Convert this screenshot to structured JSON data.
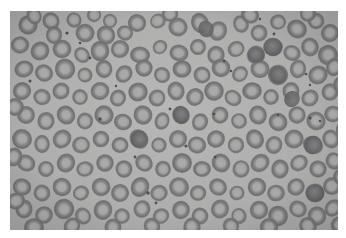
{
  "figure": {
    "kind": "photomicrograph",
    "modality": "light-microscopy",
    "stain": "unstained-grayscale",
    "specimen": "peripheral-blood-smear",
    "title": "Peripheral blood smear photomicrograph",
    "frame": {
      "canvas_width": 346,
      "canvas_height": 238,
      "margin_color": "#ffffff",
      "image_x": 10,
      "image_y": 11,
      "image_width": 328,
      "image_height": 219
    },
    "palette": {
      "background_light": "#bdbdba",
      "background_mid": "#b2b2b0",
      "background_dark": "#a6a6a4",
      "cell_rim_dark": "#5f6062",
      "cell_rim_mid": "#6f7073",
      "cell_rim_light": "#838486",
      "cell_center_pale": "#aeaeac",
      "cell_center_light": "#bcbcba",
      "dense_cell": "#565759",
      "platelet_dot": "#3a3b3d",
      "margin": "#ffffff"
    },
    "noise": {
      "grain_opacity": 0.16,
      "vignette_opacity": 0.1
    }
  },
  "content": {
    "field_description": "Dense monolayer of erythrocytes",
    "features": [
      "normocytic red blood cells with central pallor",
      "occasional overlapping cell clusters",
      "a few hyperdense (darker) cells",
      "scattered small dark punctate platelets and debris"
    ],
    "cell_count_approx": 260,
    "platelet_count_approx": 22
  },
  "cells": [
    {
      "x": 18,
      "y": 14,
      "r": 10.5,
      "t": 0.86,
      "p": 0.52
    },
    {
      "x": 41,
      "y": 10,
      "r": 9.0,
      "t": 0.7,
      "p": 0.62
    },
    {
      "x": 44,
      "y": 24,
      "r": 8.5,
      "t": 0.72,
      "p": 0.6
    },
    {
      "x": 64,
      "y": 9,
      "r": 8.0,
      "t": 0.62,
      "p": 0.66
    },
    {
      "x": 75,
      "y": 22,
      "r": 9.5,
      "t": 0.8,
      "p": 0.5
    },
    {
      "x": 96,
      "y": 24,
      "r": 9.0,
      "t": 0.78,
      "p": 0.54
    },
    {
      "x": 115,
      "y": 22,
      "r": 8.0,
      "t": 0.66,
      "p": 0.6
    },
    {
      "x": 100,
      "y": 10,
      "r": 7.0,
      "t": 0.58,
      "p": 0.68
    },
    {
      "x": 127,
      "y": 12,
      "r": 8.5,
      "t": 0.74,
      "p": 0.56
    },
    {
      "x": 148,
      "y": 10,
      "r": 7.5,
      "t": 0.6,
      "p": 0.7
    },
    {
      "x": 168,
      "y": 16,
      "r": 9.0,
      "t": 0.7,
      "p": 0.58
    },
    {
      "x": 190,
      "y": 12,
      "r": 9.5,
      "t": 0.82,
      "p": 0.5
    },
    {
      "x": 208,
      "y": 20,
      "r": 9.0,
      "t": 0.74,
      "p": 0.54
    },
    {
      "x": 231,
      "y": 13,
      "r": 8.5,
      "t": 0.68,
      "p": 0.62
    },
    {
      "x": 249,
      "y": 22,
      "r": 9.0,
      "t": 0.72,
      "p": 0.56
    },
    {
      "x": 268,
      "y": 11,
      "r": 8.0,
      "t": 0.64,
      "p": 0.64
    },
    {
      "x": 287,
      "y": 18,
      "r": 9.5,
      "t": 0.84,
      "p": 0.48
    },
    {
      "x": 306,
      "y": 10,
      "r": 8.5,
      "t": 0.7,
      "p": 0.58
    },
    {
      "x": 320,
      "y": 22,
      "r": 9.0,
      "t": 0.76,
      "p": 0.54
    },
    {
      "x": 10,
      "y": 34,
      "r": 8.5,
      "t": 0.74,
      "p": 0.56
    },
    {
      "x": 30,
      "y": 40,
      "r": 9.5,
      "t": 0.82,
      "p": 0.48
    },
    {
      "x": 52,
      "y": 38,
      "r": 9.0,
      "t": 0.76,
      "p": 0.54
    },
    {
      "x": 72,
      "y": 44,
      "r": 8.0,
      "t": 0.66,
      "p": 0.62
    },
    {
      "x": 90,
      "y": 40,
      "r": 9.5,
      "t": 0.8,
      "p": 0.5
    },
    {
      "x": 110,
      "y": 38,
      "r": 8.5,
      "t": 0.72,
      "p": 0.58
    },
    {
      "x": 130,
      "y": 44,
      "r": 9.0,
      "t": 0.78,
      "p": 0.52
    },
    {
      "x": 150,
      "y": 36,
      "r": 7.5,
      "t": 0.6,
      "p": 0.68
    },
    {
      "x": 169,
      "y": 42,
      "r": 9.0,
      "t": 0.74,
      "p": 0.56
    },
    {
      "x": 188,
      "y": 36,
      "r": 8.5,
      "t": 0.7,
      "p": 0.6
    },
    {
      "x": 206,
      "y": 44,
      "r": 9.0,
      "t": 0.76,
      "p": 0.54
    },
    {
      "x": 226,
      "y": 38,
      "r": 8.0,
      "t": 0.64,
      "p": 0.64
    },
    {
      "x": 246,
      "y": 44,
      "r": 9.5,
      "t": 0.84,
      "p": 0.46
    },
    {
      "x": 263,
      "y": 36,
      "r": 9.0,
      "t": 0.9,
      "p": 0.3
    },
    {
      "x": 282,
      "y": 42,
      "r": 8.5,
      "t": 0.72,
      "p": 0.58
    },
    {
      "x": 300,
      "y": 36,
      "r": 9.0,
      "t": 0.76,
      "p": 0.54
    },
    {
      "x": 318,
      "y": 44,
      "r": 9.5,
      "t": 0.8,
      "p": 0.5
    },
    {
      "x": 14,
      "y": 58,
      "r": 9.0,
      "t": 0.76,
      "p": 0.54
    },
    {
      "x": 34,
      "y": 62,
      "r": 8.5,
      "t": 0.7,
      "p": 0.6
    },
    {
      "x": 55,
      "y": 58,
      "r": 9.5,
      "t": 0.82,
      "p": 0.48
    },
    {
      "x": 75,
      "y": 64,
      "r": 8.0,
      "t": 0.64,
      "p": 0.64
    },
    {
      "x": 94,
      "y": 58,
      "r": 9.0,
      "t": 0.74,
      "p": 0.56
    },
    {
      "x": 114,
      "y": 63,
      "r": 8.5,
      "t": 0.72,
      "p": 0.58
    },
    {
      "x": 134,
      "y": 57,
      "r": 9.0,
      "t": 0.78,
      "p": 0.52
    },
    {
      "x": 152,
      "y": 64,
      "r": 8.0,
      "t": 0.66,
      "p": 0.62
    },
    {
      "x": 172,
      "y": 58,
      "r": 9.5,
      "t": 0.84,
      "p": 0.46
    },
    {
      "x": 192,
      "y": 64,
      "r": 8.5,
      "t": 0.7,
      "p": 0.6
    },
    {
      "x": 211,
      "y": 57,
      "r": 9.0,
      "t": 0.76,
      "p": 0.54
    },
    {
      "x": 230,
      "y": 63,
      "r": 8.0,
      "t": 0.62,
      "p": 0.66
    },
    {
      "x": 250,
      "y": 58,
      "r": 9.0,
      "t": 0.74,
      "p": 0.56
    },
    {
      "x": 268,
      "y": 64,
      "r": 9.5,
      "t": 0.88,
      "p": 0.34
    },
    {
      "x": 288,
      "y": 58,
      "r": 8.5,
      "t": 0.72,
      "p": 0.58
    },
    {
      "x": 308,
      "y": 64,
      "r": 9.0,
      "t": 0.78,
      "p": 0.52
    },
    {
      "x": 324,
      "y": 56,
      "r": 8.5,
      "t": 0.7,
      "p": 0.6
    },
    {
      "x": 12,
      "y": 80,
      "r": 9.5,
      "t": 0.8,
      "p": 0.5
    },
    {
      "x": 32,
      "y": 86,
      "r": 8.5,
      "t": 0.72,
      "p": 0.58
    },
    {
      "x": 51,
      "y": 80,
      "r": 9.0,
      "t": 0.76,
      "p": 0.54
    },
    {
      "x": 70,
      "y": 86,
      "r": 8.0,
      "t": 0.64,
      "p": 0.64
    },
    {
      "x": 90,
      "y": 80,
      "r": 9.0,
      "t": 0.74,
      "p": 0.56
    },
    {
      "x": 108,
      "y": 87,
      "r": 8.5,
      "t": 0.7,
      "p": 0.6
    },
    {
      "x": 128,
      "y": 81,
      "r": 9.5,
      "t": 0.82,
      "p": 0.48
    },
    {
      "x": 147,
      "y": 87,
      "r": 8.0,
      "t": 0.66,
      "p": 0.62
    },
    {
      "x": 166,
      "y": 80,
      "r": 9.0,
      "t": 0.76,
      "p": 0.54
    },
    {
      "x": 185,
      "y": 86,
      "r": 8.5,
      "t": 0.72,
      "p": 0.58
    },
    {
      "x": 204,
      "y": 80,
      "r": 9.0,
      "t": 0.78,
      "p": 0.52
    },
    {
      "x": 223,
      "y": 87,
      "r": 8.0,
      "t": 0.62,
      "p": 0.66
    },
    {
      "x": 242,
      "y": 80,
      "r": 9.5,
      "t": 0.84,
      "p": 0.46
    },
    {
      "x": 261,
      "y": 86,
      "r": 8.5,
      "t": 0.7,
      "p": 0.6
    },
    {
      "x": 281,
      "y": 80,
      "r": 9.0,
      "t": 0.76,
      "p": 0.54
    },
    {
      "x": 300,
      "y": 87,
      "r": 8.5,
      "t": 0.74,
      "p": 0.56
    },
    {
      "x": 320,
      "y": 81,
      "r": 9.0,
      "t": 0.8,
      "p": 0.5
    },
    {
      "x": 16,
      "y": 104,
      "r": 9.0,
      "t": 0.78,
      "p": 0.52
    },
    {
      "x": 36,
      "y": 110,
      "r": 8.5,
      "t": 0.7,
      "p": 0.6
    },
    {
      "x": 56,
      "y": 104,
      "r": 9.5,
      "t": 0.82,
      "p": 0.48
    },
    {
      "x": 75,
      "y": 110,
      "r": 8.0,
      "t": 0.64,
      "p": 0.64
    },
    {
      "x": 94,
      "y": 104,
      "r": 9.0,
      "t": 0.76,
      "p": 0.54
    },
    {
      "x": 113,
      "y": 111,
      "r": 8.5,
      "t": 0.72,
      "p": 0.58
    },
    {
      "x": 133,
      "y": 104,
      "r": 9.0,
      "t": 0.74,
      "p": 0.56
    },
    {
      "x": 152,
      "y": 110,
      "r": 8.0,
      "t": 0.66,
      "p": 0.62
    },
    {
      "x": 171,
      "y": 104,
      "r": 9.5,
      "t": 0.86,
      "p": 0.42
    },
    {
      "x": 190,
      "y": 111,
      "r": 8.5,
      "t": 0.7,
      "p": 0.6
    },
    {
      "x": 210,
      "y": 104,
      "r": 9.0,
      "t": 0.76,
      "p": 0.54
    },
    {
      "x": 229,
      "y": 110,
      "r": 8.0,
      "t": 0.62,
      "p": 0.66
    },
    {
      "x": 248,
      "y": 104,
      "r": 9.0,
      "t": 0.78,
      "p": 0.52
    },
    {
      "x": 268,
      "y": 111,
      "r": 9.5,
      "t": 0.84,
      "p": 0.46
    },
    {
      "x": 287,
      "y": 104,
      "r": 8.5,
      "t": 0.72,
      "p": 0.58
    },
    {
      "x": 306,
      "y": 110,
      "r": 9.0,
      "t": 0.76,
      "p": 0.54
    },
    {
      "x": 323,
      "y": 103,
      "r": 8.5,
      "t": 0.74,
      "p": 0.56
    },
    {
      "x": 12,
      "y": 128,
      "r": 9.5,
      "t": 0.82,
      "p": 0.48
    },
    {
      "x": 32,
      "y": 133,
      "r": 8.5,
      "t": 0.7,
      "p": 0.6
    },
    {
      "x": 52,
      "y": 128,
      "r": 9.0,
      "t": 0.76,
      "p": 0.54
    },
    {
      "x": 71,
      "y": 134,
      "r": 8.0,
      "t": 0.64,
      "p": 0.64
    },
    {
      "x": 91,
      "y": 128,
      "r": 9.0,
      "t": 0.8,
      "p": 0.5
    },
    {
      "x": 110,
      "y": 134,
      "r": 8.5,
      "t": 0.72,
      "p": 0.58
    },
    {
      "x": 129,
      "y": 128,
      "r": 9.5,
      "t": 0.86,
      "p": 0.42
    },
    {
      "x": 149,
      "y": 134,
      "r": 8.0,
      "t": 0.66,
      "p": 0.62
    },
    {
      "x": 168,
      "y": 128,
      "r": 9.0,
      "t": 0.74,
      "p": 0.56
    },
    {
      "x": 187,
      "y": 134,
      "r": 8.5,
      "t": 0.7,
      "p": 0.6
    },
    {
      "x": 206,
      "y": 128,
      "r": 9.0,
      "t": 0.78,
      "p": 0.52
    },
    {
      "x": 226,
      "y": 134,
      "r": 8.0,
      "t": 0.62,
      "p": 0.66
    },
    {
      "x": 245,
      "y": 128,
      "r": 9.5,
      "t": 0.84,
      "p": 0.46
    },
    {
      "x": 264,
      "y": 134,
      "r": 8.5,
      "t": 0.72,
      "p": 0.58
    },
    {
      "x": 284,
      "y": 128,
      "r": 9.0,
      "t": 0.76,
      "p": 0.54
    },
    {
      "x": 303,
      "y": 134,
      "r": 9.5,
      "t": 0.88,
      "p": 0.36
    },
    {
      "x": 321,
      "y": 128,
      "r": 8.5,
      "t": 0.7,
      "p": 0.6
    },
    {
      "x": 16,
      "y": 152,
      "r": 9.0,
      "t": 0.78,
      "p": 0.52
    },
    {
      "x": 36,
      "y": 158,
      "r": 8.5,
      "t": 0.72,
      "p": 0.58
    },
    {
      "x": 56,
      "y": 152,
      "r": 9.5,
      "t": 0.82,
      "p": 0.48
    },
    {
      "x": 75,
      "y": 158,
      "r": 8.0,
      "t": 0.64,
      "p": 0.64
    },
    {
      "x": 95,
      "y": 152,
      "r": 9.0,
      "t": 0.76,
      "p": 0.54
    },
    {
      "x": 114,
      "y": 158,
      "r": 8.5,
      "t": 0.7,
      "p": 0.6
    },
    {
      "x": 134,
      "y": 152,
      "r": 9.0,
      "t": 0.74,
      "p": 0.56
    },
    {
      "x": 153,
      "y": 158,
      "r": 8.0,
      "t": 0.66,
      "p": 0.62
    },
    {
      "x": 172,
      "y": 152,
      "r": 9.5,
      "t": 0.84,
      "p": 0.46
    },
    {
      "x": 192,
      "y": 158,
      "r": 8.5,
      "t": 0.72,
      "p": 0.58
    },
    {
      "x": 211,
      "y": 152,
      "r": 9.0,
      "t": 0.78,
      "p": 0.52
    },
    {
      "x": 231,
      "y": 158,
      "r": 8.0,
      "t": 0.62,
      "p": 0.66
    },
    {
      "x": 250,
      "y": 152,
      "r": 9.0,
      "t": 0.76,
      "p": 0.54
    },
    {
      "x": 270,
      "y": 158,
      "r": 9.5,
      "t": 0.86,
      "p": 0.42
    },
    {
      "x": 289,
      "y": 152,
      "r": 8.5,
      "t": 0.7,
      "p": 0.6
    },
    {
      "x": 308,
      "y": 158,
      "r": 9.0,
      "t": 0.8,
      "p": 0.5
    },
    {
      "x": 324,
      "y": 150,
      "r": 8.5,
      "t": 0.74,
      "p": 0.56
    },
    {
      "x": 12,
      "y": 176,
      "r": 9.5,
      "t": 0.82,
      "p": 0.48
    },
    {
      "x": 32,
      "y": 182,
      "r": 8.5,
      "t": 0.7,
      "p": 0.6
    },
    {
      "x": 52,
      "y": 176,
      "r": 9.0,
      "t": 0.76,
      "p": 0.54
    },
    {
      "x": 71,
      "y": 182,
      "r": 8.0,
      "t": 0.64,
      "p": 0.64
    },
    {
      "x": 91,
      "y": 176,
      "r": 9.0,
      "t": 0.78,
      "p": 0.52
    },
    {
      "x": 110,
      "y": 182,
      "r": 8.5,
      "t": 0.72,
      "p": 0.58
    },
    {
      "x": 130,
      "y": 176,
      "r": 9.5,
      "t": 0.84,
      "p": 0.46
    },
    {
      "x": 149,
      "y": 182,
      "r": 8.0,
      "t": 0.66,
      "p": 0.62
    },
    {
      "x": 169,
      "y": 176,
      "r": 9.0,
      "t": 0.74,
      "p": 0.56
    },
    {
      "x": 188,
      "y": 182,
      "r": 8.5,
      "t": 0.7,
      "p": 0.6
    },
    {
      "x": 208,
      "y": 176,
      "r": 9.0,
      "t": 0.76,
      "p": 0.54
    },
    {
      "x": 227,
      "y": 182,
      "r": 8.0,
      "t": 0.62,
      "p": 0.66
    },
    {
      "x": 247,
      "y": 176,
      "r": 9.5,
      "t": 0.82,
      "p": 0.48
    },
    {
      "x": 266,
      "y": 182,
      "r": 8.5,
      "t": 0.72,
      "p": 0.58
    },
    {
      "x": 286,
      "y": 176,
      "r": 9.0,
      "t": 0.78,
      "p": 0.52
    },
    {
      "x": 305,
      "y": 182,
      "r": 9.5,
      "t": 0.88,
      "p": 0.36
    },
    {
      "x": 322,
      "y": 175,
      "r": 8.5,
      "t": 0.7,
      "p": 0.6
    },
    {
      "x": 14,
      "y": 198,
      "r": 9.0,
      "t": 0.76,
      "p": 0.54
    },
    {
      "x": 34,
      "y": 204,
      "r": 8.5,
      "t": 0.72,
      "p": 0.58
    },
    {
      "x": 54,
      "y": 198,
      "r": 9.5,
      "t": 0.82,
      "p": 0.48
    },
    {
      "x": 73,
      "y": 205,
      "r": 8.0,
      "t": 0.64,
      "p": 0.64
    },
    {
      "x": 93,
      "y": 199,
      "r": 9.0,
      "t": 0.78,
      "p": 0.52
    },
    {
      "x": 112,
      "y": 205,
      "r": 8.5,
      "t": 0.7,
      "p": 0.6
    },
    {
      "x": 132,
      "y": 198,
      "r": 9.0,
      "t": 0.74,
      "p": 0.56
    },
    {
      "x": 151,
      "y": 205,
      "r": 8.0,
      "t": 0.66,
      "p": 0.62
    },
    {
      "x": 171,
      "y": 199,
      "r": 9.5,
      "t": 0.84,
      "p": 0.46
    },
    {
      "x": 190,
      "y": 205,
      "r": 8.5,
      "t": 0.72,
      "p": 0.58
    },
    {
      "x": 210,
      "y": 198,
      "r": 9.0,
      "t": 0.76,
      "p": 0.54
    },
    {
      "x": 229,
      "y": 205,
      "r": 8.0,
      "t": 0.62,
      "p": 0.66
    },
    {
      "x": 249,
      "y": 199,
      "r": 9.0,
      "t": 0.8,
      "p": 0.5
    },
    {
      "x": 268,
      "y": 205,
      "r": 9.5,
      "t": 0.86,
      "p": 0.42
    },
    {
      "x": 288,
      "y": 198,
      "r": 8.5,
      "t": 0.7,
      "p": 0.6
    },
    {
      "x": 307,
      "y": 205,
      "r": 9.0,
      "t": 0.78,
      "p": 0.52
    },
    {
      "x": 323,
      "y": 197,
      "r": 8.5,
      "t": 0.74,
      "p": 0.56
    },
    {
      "x": 24,
      "y": 216,
      "r": 9.0,
      "t": 0.76,
      "p": 0.54
    },
    {
      "x": 62,
      "y": 215,
      "r": 8.5,
      "t": 0.7,
      "p": 0.6
    },
    {
      "x": 103,
      "y": 216,
      "r": 9.0,
      "t": 0.78,
      "p": 0.52
    },
    {
      "x": 142,
      "y": 215,
      "r": 8.5,
      "t": 0.72,
      "p": 0.58
    },
    {
      "x": 182,
      "y": 216,
      "r": 9.0,
      "t": 0.76,
      "p": 0.54
    },
    {
      "x": 221,
      "y": 215,
      "r": 8.5,
      "t": 0.7,
      "p": 0.6
    },
    {
      "x": 259,
      "y": 216,
      "r": 9.0,
      "t": 0.8,
      "p": 0.5
    },
    {
      "x": 298,
      "y": 215,
      "r": 8.5,
      "t": 0.72,
      "p": 0.58
    },
    {
      "x": 330,
      "y": 214,
      "r": 9.0,
      "t": 0.78,
      "p": 0.52
    },
    {
      "x": 5,
      "y": 96,
      "r": 8.5,
      "t": 0.72,
      "p": 0.58
    },
    {
      "x": 4,
      "y": 146,
      "r": 9.0,
      "t": 0.76,
      "p": 0.54
    },
    {
      "x": 6,
      "y": 190,
      "r": 8.5,
      "t": 0.7,
      "p": 0.6
    },
    {
      "x": 333,
      "y": 74,
      "r": 9.0,
      "t": 0.8,
      "p": 0.5
    },
    {
      "x": 334,
      "y": 120,
      "r": 8.5,
      "t": 0.74,
      "p": 0.56
    },
    {
      "x": 332,
      "y": 166,
      "r": 9.0,
      "t": 0.78,
      "p": 0.52
    },
    {
      "x": 24,
      "y": 5,
      "r": 8.0,
      "t": 0.66,
      "p": 0.62
    },
    {
      "x": 84,
      "y": 4,
      "r": 7.5,
      "t": 0.6,
      "p": 0.68
    },
    {
      "x": 160,
      "y": 3,
      "r": 8.0,
      "t": 0.64,
      "p": 0.64
    },
    {
      "x": 240,
      "y": 4,
      "r": 8.5,
      "t": 0.7,
      "p": 0.6
    },
    {
      "x": 298,
      "y": 3,
      "r": 8.0,
      "t": 0.66,
      "p": 0.62
    }
  ],
  "dense_cells": [
    {
      "x": 263,
      "y": 36,
      "r": 10.0
    },
    {
      "x": 268,
      "y": 64,
      "r": 9.0
    },
    {
      "x": 303,
      "y": 134,
      "r": 9.5
    },
    {
      "x": 305,
      "y": 182,
      "r": 9.5
    },
    {
      "x": 171,
      "y": 104,
      "r": 9.0
    },
    {
      "x": 129,
      "y": 128,
      "r": 9.0
    },
    {
      "x": 246,
      "y": 44,
      "r": 8.5
    },
    {
      "x": 196,
      "y": 18,
      "r": 8.5
    },
    {
      "x": 282,
      "y": 88,
      "r": 8.5
    }
  ],
  "platelets": [
    {
      "x": 57,
      "y": 22,
      "r": 1.6
    },
    {
      "x": 70,
      "y": 32,
      "r": 1.3
    },
    {
      "x": 80,
      "y": 47,
      "r": 1.4
    },
    {
      "x": 20,
      "y": 70,
      "r": 1.5
    },
    {
      "x": 106,
      "y": 75,
      "r": 1.2
    },
    {
      "x": 160,
      "y": 98,
      "r": 1.4
    },
    {
      "x": 90,
      "y": 108,
      "r": 1.7
    },
    {
      "x": 214,
      "y": 50,
      "r": 1.3
    },
    {
      "x": 221,
      "y": 60,
      "r": 1.2
    },
    {
      "x": 264,
      "y": 23,
      "r": 1.4
    },
    {
      "x": 296,
      "y": 63,
      "r": 1.3
    },
    {
      "x": 300,
      "y": 107,
      "r": 1.5
    },
    {
      "x": 268,
      "y": 104,
      "r": 1.2
    },
    {
      "x": 204,
      "y": 103,
      "r": 1.3
    },
    {
      "x": 176,
      "y": 135,
      "r": 1.6
    },
    {
      "x": 125,
      "y": 146,
      "r": 1.4
    },
    {
      "x": 205,
      "y": 146,
      "r": 1.3
    },
    {
      "x": 138,
      "y": 182,
      "r": 1.7
    },
    {
      "x": 146,
      "y": 192,
      "r": 1.4
    },
    {
      "x": 300,
      "y": 74,
      "r": 1.2
    },
    {
      "x": 310,
      "y": 110,
      "r": 1.3
    },
    {
      "x": 250,
      "y": 8,
      "r": 1.2
    }
  ]
}
